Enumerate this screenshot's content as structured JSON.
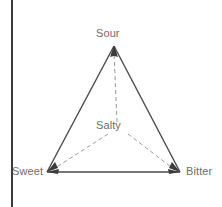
{
  "figure": {
    "type": "triangle-diagram",
    "background_color": "#ffffff",
    "canvas": {
      "width": 222,
      "height": 207
    }
  },
  "page_border": {
    "name": "left-vertical-rule",
    "color": "#3b3b3b",
    "x": 11,
    "width": 2,
    "y_start": 0,
    "y_end": 207
  },
  "vertices": [
    {
      "id": "sour",
      "label": "Sour",
      "x": 114,
      "y": 46,
      "label_x": 96,
      "label_y": 27
    },
    {
      "id": "sweet",
      "label": "Sweet",
      "x": 47,
      "y": 172,
      "label_x": 12,
      "label_y": 165
    },
    {
      "id": "bitter",
      "label": "Bitter",
      "x": 180,
      "y": 172,
      "label_x": 186,
      "label_y": 165
    }
  ],
  "center": {
    "id": "salty",
    "label": "Salty",
    "x": 117,
    "y": 128,
    "label_x": 96,
    "label_y": 119
  },
  "edges": [
    {
      "from": "sour",
      "to": "sweet",
      "style": "solid",
      "arrowheads": "both"
    },
    {
      "from": "sour",
      "to": "bitter",
      "style": "solid",
      "arrowheads": "both"
    },
    {
      "from": "sweet",
      "to": "bitter",
      "style": "solid",
      "arrowheads": "both"
    }
  ],
  "spokes": [
    {
      "from": "salty",
      "to": "sour",
      "style": "dashed"
    },
    {
      "from": "salty",
      "to": "sweet",
      "style": "dashed"
    },
    {
      "from": "salty",
      "to": "bitter",
      "style": "dashed"
    }
  ],
  "colors": {
    "edge": "#4a4a4a",
    "spoke": "#9a9a9a",
    "text": "#6e6e6e",
    "border": "#3b3b3b",
    "background": "#ffffff"
  }
}
